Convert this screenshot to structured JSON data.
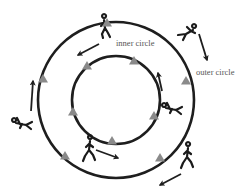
{
  "diagram": {
    "labels": {
      "inner": "inner circle",
      "outer": "outer circle"
    },
    "colors": {
      "track": "#1e1e1e",
      "cone": "#8a8a8a",
      "arrow": "#1e1e1e",
      "runner": "#1a1a1a",
      "label": "#555555"
    },
    "circles": [
      {
        "name": "outer-circle",
        "cx": 116,
        "cy": 100,
        "r": 78
      },
      {
        "name": "inner-circle",
        "cx": 116,
        "cy": 100,
        "r": 44
      }
    ],
    "cones": {
      "outer": [
        [
          107,
          23
        ],
        [
          43,
          79
        ],
        [
          65,
          156
        ],
        [
          160,
          158
        ],
        [
          186,
          81
        ]
      ],
      "inner": [
        [
          87,
          66
        ],
        [
          134,
          61
        ],
        [
          73,
          112
        ],
        [
          112,
          141
        ],
        [
          154,
          116
        ]
      ]
    },
    "arrows": [
      {
        "name": "arrow-top",
        "from": [
          99,
          44
        ],
        "to": [
          78,
          55
        ]
      },
      {
        "name": "arrow-right-outer",
        "from": [
          199,
          34
        ],
        "to": [
          207,
          60
        ]
      },
      {
        "name": "arrow-left",
        "from": [
          31,
          111
        ],
        "to": [
          33,
          81
        ]
      },
      {
        "name": "arrow-right-inner",
        "from": [
          162,
          91
        ],
        "to": [
          158,
          73
        ]
      },
      {
        "name": "arrow-bottom-inner",
        "from": [
          96,
          150
        ],
        "to": [
          118,
          158
        ]
      },
      {
        "name": "arrow-bottom-outer",
        "from": [
          181,
          174
        ],
        "to": [
          160,
          185
        ]
      }
    ],
    "runners": [
      {
        "name": "runner-top",
        "x": 104,
        "y": 28,
        "pose": "standing"
      },
      {
        "name": "runner-top-right",
        "x": 186,
        "y": 34,
        "pose": "leaning"
      },
      {
        "name": "runner-left",
        "x": 22,
        "y": 124,
        "pose": "diving"
      },
      {
        "name": "runner-right",
        "x": 172,
        "y": 109,
        "pose": "diving"
      },
      {
        "name": "runner-bottom",
        "x": 90,
        "y": 150,
        "pose": "running"
      },
      {
        "name": "runner-bottom-right",
        "x": 188,
        "y": 157,
        "pose": "running"
      }
    ]
  }
}
